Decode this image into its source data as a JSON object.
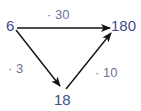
{
  "diagram": {
    "type": "directed-graph",
    "nodes": [
      {
        "id": "n6",
        "label": "6"
      },
      {
        "id": "n180",
        "label": "180"
      },
      {
        "id": "n18",
        "label": "18"
      }
    ],
    "edges": [
      {
        "from": "n6",
        "to": "n180",
        "label": "· 30"
      },
      {
        "from": "n6",
        "to": "n18",
        "label": "· 3"
      },
      {
        "from": "n18",
        "to": "n180",
        "label": "· 10"
      }
    ],
    "colors": {
      "node_text": "#3e4b8c",
      "edge_text": "#6b7299",
      "arrow": "#111111"
    }
  }
}
